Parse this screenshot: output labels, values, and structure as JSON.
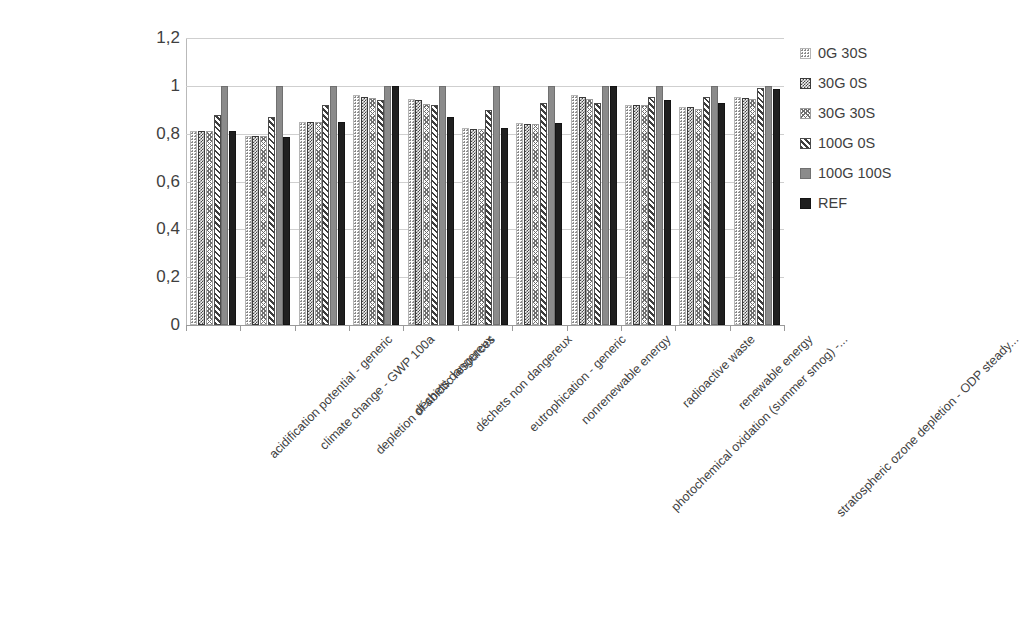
{
  "chart_data": {
    "type": "bar",
    "title": "",
    "xlabel": "",
    "ylabel": "",
    "ylim": [
      0,
      1.2
    ],
    "grid": true,
    "legend_position": "right",
    "y_ticks": [
      "0",
      "0,2",
      "0,4",
      "0,6",
      "0,8",
      "1",
      "1,2"
    ],
    "y_tick_values": [
      0,
      0.2,
      0.4,
      0.6,
      0.8,
      1.0,
      1.2
    ],
    "decimal_separator": ",",
    "categories": [
      "acidification potential - generic",
      "climate change - GWP 100a",
      "depletion of abiotic resources",
      "déchets dangereux",
      "déchets non dangereux",
      "eutrophication - generic",
      "nonrenewable energy",
      "photochemical oxidation (summer smog) -...",
      "radioactive waste",
      "renewable energy",
      "stratospheric ozone depletion - ODP steady..."
    ],
    "series": [
      {
        "name": "0G 30S",
        "pattern": "dots",
        "color": "#ffffff",
        "values": [
          0.81,
          0.79,
          0.85,
          0.96,
          0.945,
          0.825,
          0.845,
          0.96,
          0.92,
          0.91,
          0.955
        ]
      },
      {
        "name": "30G 0S",
        "pattern": "checker",
        "color": "#454545",
        "values": [
          0.81,
          0.79,
          0.85,
          0.955,
          0.94,
          0.82,
          0.84,
          0.955,
          0.92,
          0.91,
          0.95
        ]
      },
      {
        "name": "30G 30S",
        "pattern": "zigzag",
        "color": "#6f6f6f",
        "values": [
          0.81,
          0.79,
          0.85,
          0.95,
          0.925,
          0.82,
          0.84,
          0.945,
          0.92,
          0.905,
          0.945
        ]
      },
      {
        "name": "100G 0S",
        "pattern": "diagonal",
        "color": "#3d3d3d",
        "values": [
          0.88,
          0.87,
          0.92,
          0.94,
          0.92,
          0.9,
          0.93,
          0.93,
          0.955,
          0.955,
          0.99
        ]
      },
      {
        "name": "100G 100S",
        "pattern": "solid-gray",
        "color": "#8b8b8b",
        "values": [
          1.0,
          1.0,
          1.0,
          1.0,
          1.0,
          1.0,
          1.0,
          1.0,
          1.0,
          1.0,
          1.0
        ]
      },
      {
        "name": "REF",
        "pattern": "solid-black",
        "color": "#1f1f1f",
        "values": [
          0.81,
          0.785,
          0.85,
          1.0,
          0.87,
          0.825,
          0.845,
          1.0,
          0.94,
          0.93,
          0.985
        ]
      }
    ]
  }
}
